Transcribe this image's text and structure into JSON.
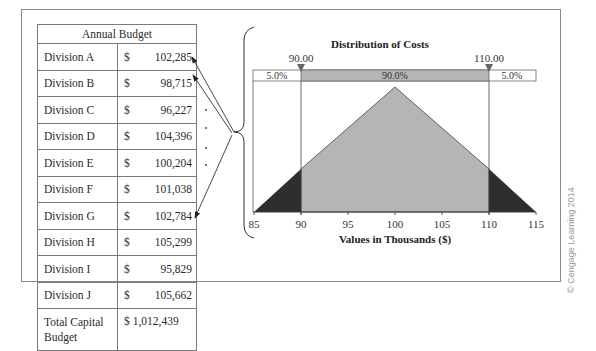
{
  "table": {
    "header": "Annual Budget",
    "rows": [
      {
        "division": "Division A",
        "currency": "$",
        "amount": "102,285"
      },
      {
        "division": "Division B",
        "currency": "$",
        "amount": "98,715"
      },
      {
        "division": "Division C",
        "currency": "$",
        "amount": "96,227"
      },
      {
        "division": "Division D",
        "currency": "$",
        "amount": "104,396"
      },
      {
        "division": "Division E",
        "currency": "$",
        "amount": "100,204"
      },
      {
        "division": "Division F",
        "currency": "$",
        "amount": "101,038"
      },
      {
        "division": "Division G",
        "currency": "$",
        "amount": "102,784"
      },
      {
        "division": "Division H",
        "currency": "$",
        "amount": "105,299"
      },
      {
        "division": "Division I",
        "currency": "$",
        "amount": "95,829"
      },
      {
        "division": "Division J",
        "currency": "$",
        "amount": "105,662"
      }
    ],
    "total_label": "Total Capital Budget",
    "total_amount": "$ 1,012,439"
  },
  "chart": {
    "title": "Distribution of Costs",
    "xlabel": "Values in Thousands ($)",
    "left_marker": "90.00",
    "right_marker": "110.00",
    "left_pct": "5.0%",
    "mid_pct": "90.0%",
    "right_pct": "5.0%",
    "ticks": [
      "85",
      "90",
      "95",
      "100",
      "105",
      "110",
      "115"
    ]
  },
  "chart_data": {
    "type": "area",
    "title": "Distribution of Costs",
    "xlabel": "Values in Thousands ($)",
    "ylabel": "",
    "distribution": "triangular",
    "min": 85,
    "mode": 100,
    "max": 115,
    "x": [
      85,
      100,
      115
    ],
    "y": [
      0,
      1,
      0
    ],
    "xlim": [
      85,
      115
    ],
    "tick_labels": [
      "85",
      "90",
      "95",
      "100",
      "105",
      "110",
      "115"
    ],
    "markers": [
      {
        "label": "90.00",
        "x": 90
      },
      {
        "label": "110.00",
        "x": 110
      }
    ],
    "regions": [
      {
        "range": [
          85,
          90
        ],
        "probability": "5.0%"
      },
      {
        "range": [
          90,
          110
        ],
        "probability": "90.0%"
      },
      {
        "range": [
          110,
          115
        ],
        "probability": "5.0%"
      }
    ]
  },
  "credit": "© Cengage Learning 2014"
}
